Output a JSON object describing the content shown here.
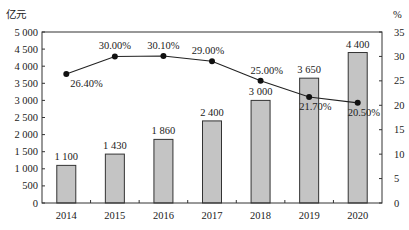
{
  "chart_data": {
    "type": "bar+line",
    "title": "",
    "categories": [
      "2014",
      "2015",
      "2016",
      "2017",
      "2018",
      "2019",
      "2020"
    ],
    "series": [
      {
        "name": "bar",
        "axis": "left",
        "type": "bar",
        "values": [
          1100,
          1430,
          1860,
          2400,
          3000,
          3650,
          4400
        ],
        "labels": [
          "1 100",
          "1 430",
          "1 860",
          "2 400",
          "3 000",
          "3 650",
          "4 400"
        ]
      },
      {
        "name": "line",
        "axis": "right",
        "type": "line",
        "values": [
          26.4,
          30.0,
          30.1,
          29.0,
          25.0,
          21.7,
          20.5
        ],
        "labels": [
          "26.40%",
          "30.00%",
          "30.10%",
          "29.00%",
          "25.00%",
          "21.70%",
          "20.50%"
        ]
      }
    ],
    "ylabel": "亿元",
    "y2label": "%",
    "ylim": [
      0,
      5000
    ],
    "y2lim": [
      0,
      35
    ],
    "yticks": [
      "0",
      "500",
      "1 000",
      "1 500",
      "2 000",
      "2 500",
      "3 000",
      "3 500",
      "4 000",
      "4 500",
      "5 000"
    ],
    "y2ticks": [
      "0",
      "5",
      "10",
      "15",
      "20",
      "25",
      "30",
      "35"
    ],
    "grid": false,
    "legend": null,
    "colors": {
      "bar_fill": "#c4c4c4",
      "bar_stroke": "#333333",
      "line": "#222222"
    }
  }
}
